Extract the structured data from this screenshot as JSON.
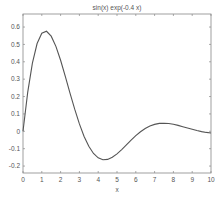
{
  "chart_data": {
    "type": "line",
    "title": "sin(x) exp(-0.4 x)",
    "xlabel": "x",
    "ylabel": "",
    "xlim": [
      0,
      10
    ],
    "ylim": [
      -0.24,
      0.675
    ],
    "grid": false,
    "legend": null,
    "x_ticks": [
      0,
      1,
      2,
      3,
      4,
      5,
      6,
      7,
      8,
      9,
      10
    ],
    "x_tick_labels": [
      "0",
      "1",
      "2",
      "3",
      "4",
      "5",
      "6",
      "7",
      "8",
      "9",
      "10"
    ],
    "y_ticks": [
      -0.2,
      -0.1,
      0,
      0.1,
      0.2,
      0.3,
      0.4,
      0.5,
      0.6
    ],
    "y_tick_labels": [
      "-0.2",
      "-0.1",
      "0",
      "0.1",
      "0.2",
      "0.3",
      "0.4",
      "0.5",
      "0.6"
    ],
    "series": [
      {
        "name": "sin(x) exp(-0.4 x)",
        "color": "#555555",
        "x": [
          0,
          0.25,
          0.5,
          0.75,
          1,
          1.25,
          1.5,
          1.75,
          2,
          2.25,
          2.5,
          2.75,
          3,
          3.25,
          3.5,
          3.75,
          4,
          4.25,
          4.5,
          4.75,
          5,
          5.25,
          5.5,
          5.75,
          6,
          6.25,
          6.5,
          6.75,
          7,
          7.25,
          7.5,
          7.75,
          8,
          8.25,
          8.5,
          8.75,
          9,
          9.25,
          9.5,
          9.75,
          10
        ],
        "y": [
          0,
          0.2239,
          0.3925,
          0.505,
          0.564,
          0.5756,
          0.5474,
          0.4886,
          0.4086,
          0.3164,
          0.2202,
          0.1271,
          0.0425,
          -0.0295,
          -0.0865,
          -0.1275,
          -0.1528,
          -0.1635,
          -0.1616,
          -0.1495,
          -0.1298,
          -0.1052,
          -0.0782,
          -0.051,
          -0.0253,
          -0.0027,
          0.016,
          0.0302,
          0.0399,
          0.0453,
          0.0467,
          0.0448,
          0.0403,
          0.034,
          0.0267,
          0.0189,
          0.0113,
          0.0043,
          -0.0017,
          -0.0065,
          -0.01
        ]
      }
    ]
  },
  "colors": {
    "axis": "#888888",
    "line": "#555555",
    "text": "#555555",
    "background": "#ffffff"
  }
}
